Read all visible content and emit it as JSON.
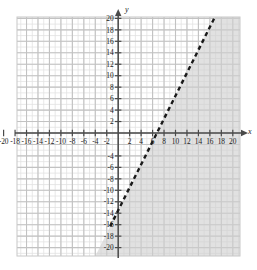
{
  "figure": {
    "kind": "coordinate-plane-inequality-graph",
    "background_color": "#ffffff",
    "plot_area": {
      "left": 17,
      "top": 17,
      "right": 240,
      "bottom": 256,
      "border_color": "#c8c8c8",
      "minor_grid_color": "#e2e2e2",
      "major_grid_color": "#c2c2c2",
      "shade_color": "#cfcfcf",
      "shade_opacity": 0.62
    },
    "axes": {
      "axis_color": "#4a4a4a",
      "origin_px": {
        "x": 118.2,
        "y": 133.0
      },
      "px_per_unit": 5.73,
      "x_label": "x",
      "y_label": "y",
      "x_label_pos": {
        "x": 248,
        "y": 134
      },
      "y_label_pos": {
        "x": 125,
        "y": 12
      }
    }
  },
  "chart_data": {
    "type": "line",
    "title": "",
    "xlabel": "x",
    "ylabel": "y",
    "xlim": [
      -21.5,
      21.5
    ],
    "ylim": [
      -21.5,
      21.5
    ],
    "grid": true,
    "legend": "none",
    "minor_tick_step": 1,
    "major_tick_step": 2,
    "x_tick_labels": [
      "-20",
      "-18",
      "-16",
      "-14",
      "-12",
      "-10",
      "-8",
      "-6",
      "-4",
      "-2",
      "2",
      "4",
      "6",
      "8",
      "10",
      "12",
      "14",
      "16",
      "18",
      "20"
    ],
    "x_tick_values": [
      -20,
      -18,
      -16,
      -14,
      -12,
      -10,
      -8,
      -6,
      -4,
      -2,
      2,
      4,
      6,
      8,
      10,
      12,
      14,
      16,
      18,
      20
    ],
    "y_tick_labels": [
      "20",
      "18",
      "16",
      "14",
      "12",
      "10",
      "8",
      "6",
      "4",
      "2",
      "-4",
      "-6",
      "-8",
      "-10",
      "-12",
      "-14",
      "-16",
      "-18",
      "-20"
    ],
    "y_tick_values": [
      20,
      18,
      16,
      14,
      12,
      10,
      8,
      6,
      4,
      2,
      -4,
      -6,
      -8,
      -10,
      -12,
      -14,
      -16,
      -18,
      -20
    ],
    "series": [
      {
        "name": "boundary-line",
        "style": "dashed",
        "color": "#1a1a1a",
        "slope": 2,
        "intercept": -13.5,
        "x_intercept": 6.75,
        "endpoints": [
          {
            "x": -1.4,
            "y": -16.3
          },
          {
            "x": 17.4,
            "y": 21.3
          }
        ]
      }
    ],
    "shaded_region": {
      "relation": "below-right-of-boundary",
      "description": "region below the dashed line",
      "boundary_included": false
    }
  }
}
